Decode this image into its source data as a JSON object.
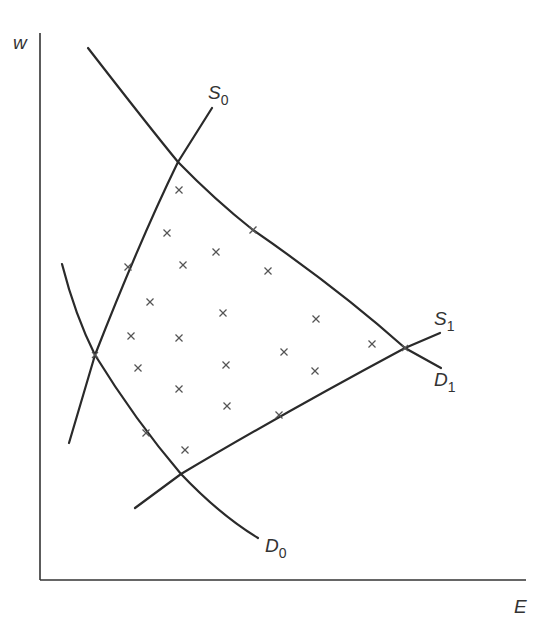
{
  "diagram": {
    "axes": {
      "y_label": "w",
      "x_label": "E"
    },
    "curves": [
      {
        "id": "S0",
        "name": "S",
        "subscript": "0",
        "type": "supply"
      },
      {
        "id": "S1",
        "name": "S",
        "subscript": "1",
        "type": "supply"
      },
      {
        "id": "D0",
        "name": "D",
        "subscript": "0",
        "type": "demand"
      },
      {
        "id": "D1",
        "name": "D",
        "subscript": "1",
        "type": "demand"
      }
    ],
    "marker_symbol": "×",
    "marker_count": 27,
    "colors": {
      "line": "#2a2a2a",
      "marker": "#555555",
      "background": "#ffffff"
    }
  },
  "chart_data": {
    "type": "scatter",
    "title": "",
    "xlabel": "E",
    "ylabel": "w",
    "curves": [
      "S0",
      "S1",
      "D0",
      "D1"
    ],
    "intersections": [
      {
        "curves": [
          "S0",
          "D1"
        ],
        "x_px": 178,
        "y_px": 162
      },
      {
        "curves": [
          "S0",
          "D0"
        ],
        "x_px": 95,
        "y_px": 355
      },
      {
        "curves": [
          "S1",
          "D1"
        ],
        "x_px": 405,
        "y_px": 348
      },
      {
        "curves": [
          "S1",
          "D0"
        ],
        "x_px": 181,
        "y_px": 474
      }
    ],
    "points_px": [
      [
        179,
        190
      ],
      [
        167,
        233
      ],
      [
        253,
        230
      ],
      [
        216,
        252
      ],
      [
        183,
        265
      ],
      [
        128,
        267
      ],
      [
        268,
        271
      ],
      [
        150,
        302
      ],
      [
        223,
        313
      ],
      [
        316,
        319
      ],
      [
        131,
        336
      ],
      [
        179,
        338
      ],
      [
        372,
        344
      ],
      [
        284,
        352
      ],
      [
        138,
        368
      ],
      [
        226,
        365
      ],
      [
        315,
        371
      ],
      [
        179,
        389
      ],
      [
        227,
        406
      ],
      [
        279,
        415
      ],
      [
        146,
        433
      ],
      [
        185,
        450
      ]
    ],
    "grid": false,
    "legend": "none"
  }
}
